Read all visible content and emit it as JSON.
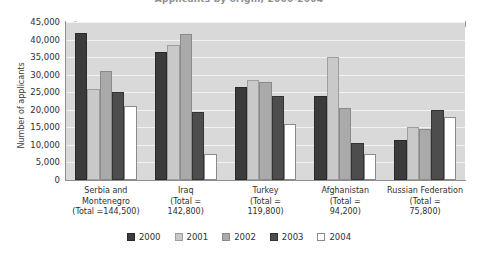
{
  "chart_data": {
    "type": "bar",
    "title": "Applicants by origin, 2000-2004",
    "xlabel": "",
    "ylabel": "Number of applicants",
    "ylim": [
      0,
      45000
    ],
    "ytick_labels": [
      "0",
      "5,000",
      "10,000",
      "15,000",
      "20,000",
      "25,000",
      "30,000",
      "35,000",
      "40,000",
      "45,000"
    ],
    "ytick_values": [
      0,
      5000,
      10000,
      15000,
      20000,
      25000,
      30000,
      35000,
      40000,
      45000
    ],
    "grid": true,
    "legend_position": "bottom",
    "categories": [
      "Serbia and Montenegro",
      "Iraq",
      "Turkey",
      "Afghanistan",
      "Russian Federation"
    ],
    "category_labels": [
      [
        "Serbia and",
        "Montenegro",
        "(Total =144,500)"
      ],
      [
        "Iraq",
        "(Total =",
        "142,800)"
      ],
      [
        "Turkey",
        "(Total =",
        "119,800)"
      ],
      [
        "Afghanistan",
        "(Total =",
        "94,200)"
      ],
      [
        "Russian Federation",
        "(Total =",
        "75,800)"
      ]
    ],
    "category_totals": [
      144500,
      142800,
      119800,
      94200,
      75800
    ],
    "series": [
      {
        "name": "2000",
        "color": "#3b3b3b",
        "values": [
          42000,
          36500,
          26500,
          24000,
          11500
        ]
      },
      {
        "name": "2001",
        "color": "#c9c9c9",
        "values": [
          26000,
          38500,
          28500,
          35000,
          15000
        ]
      },
      {
        "name": "2002",
        "color": "#aaaaaa",
        "values": [
          31000,
          41500,
          28000,
          20500,
          14500
        ]
      },
      {
        "name": "2003",
        "color": "#4d4d4d",
        "values": [
          25000,
          19500,
          24000,
          10500,
          20000
        ]
      },
      {
        "name": "2004",
        "color": "#ffffff",
        "values": [
          21000,
          7500,
          16000,
          7500,
          18000
        ]
      }
    ]
  },
  "legend": {
    "items": [
      {
        "label": "2000"
      },
      {
        "label": "2001"
      },
      {
        "label": "2002"
      },
      {
        "label": "2003"
      },
      {
        "label": "2004"
      }
    ]
  }
}
